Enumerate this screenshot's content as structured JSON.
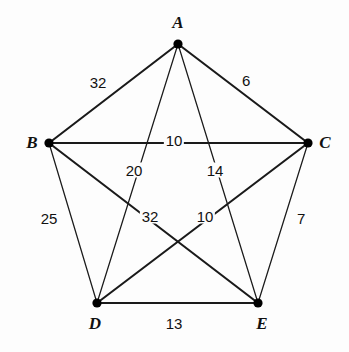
{
  "figure": {
    "type": "weighted-graph",
    "background_color": "#fdfdfd",
    "line_color": "#1a1a1a",
    "vertex_color": "#000000",
    "width": 349,
    "height": 352
  },
  "vertices": [
    {
      "id": "A",
      "label": "A",
      "x": 178,
      "y": 44,
      "label_x": 178,
      "label_y": 22
    },
    {
      "id": "B",
      "label": "B",
      "x": 49,
      "y": 143,
      "label_x": 32,
      "label_y": 142
    },
    {
      "id": "C",
      "label": "C",
      "x": 308,
      "y": 143,
      "label_x": 325,
      "label_y": 142
    },
    {
      "id": "D",
      "label": "D",
      "x": 97,
      "y": 303,
      "label_x": 95,
      "label_y": 323
    },
    {
      "id": "E",
      "label": "E",
      "x": 258,
      "y": 303,
      "label_x": 262,
      "label_y": 323
    }
  ],
  "edges": [
    {
      "id": "AB",
      "from": "A",
      "to": "B",
      "weight": "32",
      "label_x": 98,
      "label_y": 82,
      "thick": true
    },
    {
      "id": "AC",
      "from": "A",
      "to": "C",
      "weight": "6",
      "label_x": 246,
      "label_y": 80,
      "thick": true
    },
    {
      "id": "AD",
      "from": "A",
      "to": "D",
      "weight": "20",
      "label_x": 134,
      "label_y": 170,
      "thick": false
    },
    {
      "id": "AE",
      "from": "A",
      "to": "E",
      "weight": "14",
      "label_x": 215,
      "label_y": 170,
      "thick": false
    },
    {
      "id": "BC",
      "from": "B",
      "to": "C",
      "weight": "10",
      "label_x": 174,
      "label_y": 140,
      "thick": true
    },
    {
      "id": "BD",
      "from": "B",
      "to": "D",
      "weight": "25",
      "label_x": 49,
      "label_y": 218,
      "thick": false
    },
    {
      "id": "BE",
      "from": "B",
      "to": "E",
      "weight": "32",
      "label_x": 150,
      "label_y": 216,
      "thick": true
    },
    {
      "id": "CD",
      "from": "C",
      "to": "D",
      "weight": "10",
      "label_x": 205,
      "label_y": 216,
      "thick": true
    },
    {
      "id": "CE",
      "from": "C",
      "to": "E",
      "weight": "7",
      "label_x": 301,
      "label_y": 218,
      "thick": false
    },
    {
      "id": "DE",
      "from": "D",
      "to": "E",
      "weight": "13",
      "label_x": 174,
      "label_y": 323,
      "thick": true
    }
  ],
  "chart_data": {
    "type": "graph",
    "title": "",
    "nodes": [
      "A",
      "B",
      "C",
      "D",
      "E"
    ],
    "edge_list": [
      {
        "u": "A",
        "v": "B",
        "w": 32
      },
      {
        "u": "A",
        "v": "C",
        "w": 6
      },
      {
        "u": "A",
        "v": "D",
        "w": 20
      },
      {
        "u": "A",
        "v": "E",
        "w": 14
      },
      {
        "u": "B",
        "v": "C",
        "w": 10
      },
      {
        "u": "B",
        "v": "D",
        "w": 25
      },
      {
        "u": "B",
        "v": "E",
        "w": 32
      },
      {
        "u": "C",
        "v": "D",
        "w": 10
      },
      {
        "u": "C",
        "v": "E",
        "w": 7
      },
      {
        "u": "D",
        "v": "E",
        "w": 13
      }
    ]
  }
}
